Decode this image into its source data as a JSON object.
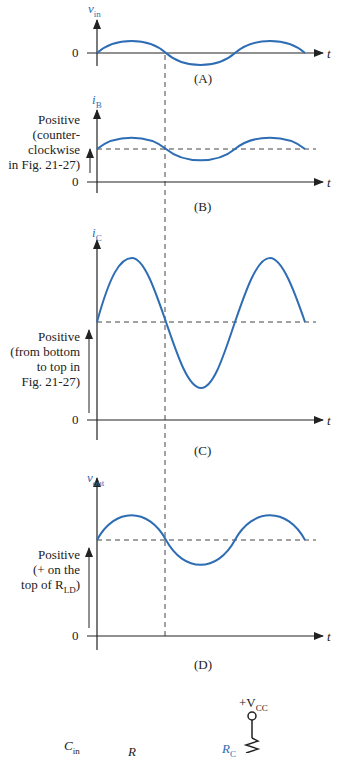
{
  "panels": {
    "A": {
      "ylabel": "v",
      "ylabel_sub": "in",
      "zero": "0",
      "xlabel": "t",
      "caption": "(A)"
    },
    "B": {
      "ylabel": "i",
      "ylabel_sub": "B",
      "zero": "0",
      "xlabel": "t",
      "caption": "(B)",
      "note": [
        "Positive",
        "(counter-",
        "clockwise",
        "in Fig. 21-27)"
      ]
    },
    "C": {
      "ylabel": "i",
      "ylabel_sub": "C",
      "zero": "0",
      "xlabel": "t",
      "caption": "(C)",
      "note": [
        "Positive",
        "(from bottom",
        "to top in",
        "Fig. 21-27)"
      ]
    },
    "D": {
      "ylabel": "v",
      "ylabel_sub": "out",
      "zero": "0",
      "xlabel": "t",
      "caption": "(D)",
      "note": [
        "Positive",
        "(+ on the",
        "top of R",
        "LD",
        ")"
      ]
    }
  },
  "circuit": {
    "vcc": "+V",
    "vcc_sub": "CC",
    "cin": "C",
    "cin_sub": "in",
    "r": "R",
    "rc": "R",
    "rc_sub": "C"
  },
  "colors": {
    "waveform": "#2e6db4",
    "axes": "#222222",
    "dashed": "#444444"
  }
}
